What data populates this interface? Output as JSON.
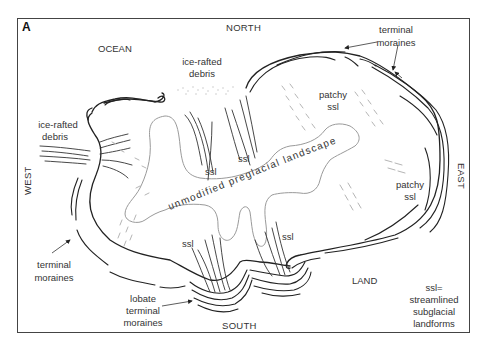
{
  "figure": {
    "panel_label": "A",
    "directions": {
      "north": "NORTH",
      "south": "SOUTH",
      "east": "EAST",
      "west": "WEST"
    },
    "regions": {
      "ocean": "OCEAN",
      "land": "LAND"
    },
    "labels": {
      "ice_rafted_debris_north": [
        "ice-rafted",
        "debris"
      ],
      "ice_rafted_debris_west": [
        "ice-rafted",
        "debris"
      ],
      "terminal_moraines_ne": [
        "terminal",
        "moraines"
      ],
      "terminal_moraines_w": [
        "terminal",
        "moraines"
      ],
      "lobate_terminal_moraines": [
        "lobate",
        "terminal",
        "moraines"
      ],
      "patchy_ssl_north": [
        "patchy",
        "ssl"
      ],
      "patchy_ssl_east": [
        "patchy",
        "ssl"
      ],
      "ssl_1": "ssl",
      "ssl_2": "ssl",
      "ssl_3": "ssl",
      "ssl_4": "ssl",
      "center": "unmodified preglacial landscape"
    },
    "legend": [
      "ssl=",
      "streamlined",
      "subglacial",
      "landforms"
    ]
  }
}
